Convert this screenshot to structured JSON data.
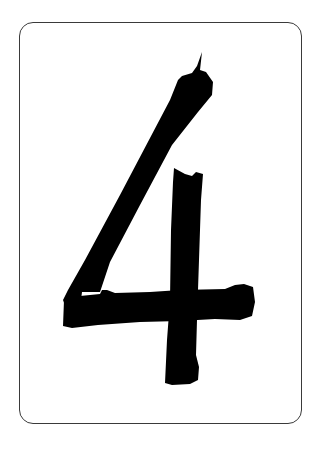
{
  "card": {
    "numeral": "4",
    "ink_color": "#000000",
    "background_color": "#ffffff",
    "border_color": "#3a3a3a"
  }
}
